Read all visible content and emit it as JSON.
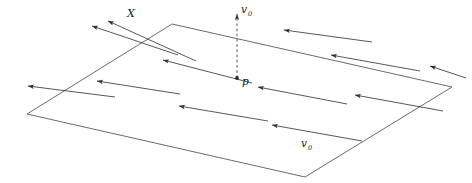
{
  "figure": {
    "background_color": "#ffffff",
    "stroke_color": "#404040",
    "label_color": "#1a1a1a",
    "width": 472,
    "height": 183
  },
  "labels": {
    "x_vector": "X",
    "v0_top": "v",
    "v0_top_sub": "0",
    "point_p": "p",
    "v0_bottom": "v",
    "v0_bottom_sub": "0"
  },
  "geometry": {
    "plane": {
      "name": "parallelogram-plane",
      "corners": [
        [
          172,
          24
        ],
        [
          452,
          87
        ],
        [
          305,
          177
        ],
        [
          27,
          114
        ]
      ]
    },
    "vertical_dashed_vector": {
      "from": [
        237,
        78
      ],
      "to": [
        237,
        14
      ],
      "style": "dashed",
      "arrowhead": "up"
    },
    "point_p_marker": [
      237,
      78
    ],
    "x_vector_arrow": {
      "from": [
        196,
        61
      ],
      "to": [
        108,
        21
      ],
      "label_at": [
        128,
        14
      ]
    },
    "field_arrows": [
      {
        "from": [
          178,
          55
        ],
        "to": [
          92,
          26
        ]
      },
      {
        "from": [
          115,
          97
        ],
        "to": [
          28,
          86
        ]
      },
      {
        "from": [
          180,
          94
        ],
        "to": [
          97,
          81
        ]
      },
      {
        "from": [
          252,
          83
        ],
        "to": [
          163,
          60
        ]
      },
      {
        "from": [
          268,
          121
        ],
        "to": [
          179,
          106
        ]
      },
      {
        "from": [
          347,
          104
        ],
        "to": [
          258,
          87
        ]
      },
      {
        "from": [
          362,
          141
        ],
        "to": [
          272,
          125
        ]
      },
      {
        "from": [
          420,
          71
        ],
        "to": [
          331,
          55
        ]
      },
      {
        "from": [
          443,
          111
        ],
        "to": [
          355,
          95
        ]
      },
      {
        "from": [
          372,
          42
        ],
        "to": [
          284,
          30
        ]
      },
      {
        "from": [
          466,
          78
        ],
        "to": [
          430,
          66
        ]
      }
    ]
  }
}
